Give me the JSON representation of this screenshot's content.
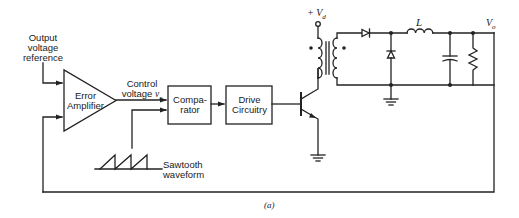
{
  "figure": {
    "caption": "(a)",
    "stroke_color": "#222222"
  },
  "labels": {
    "output_voltage_reference": [
      "Output",
      "voltage",
      "reference"
    ],
    "error_amplifier": [
      "Error",
      "Amplifier"
    ],
    "control_voltage": [
      "Control",
      "voltage"
    ],
    "control_voltage_symbol": "v",
    "control_voltage_subscript": "c",
    "comparator": [
      "Compa-",
      "rator"
    ],
    "drive_circuitry": [
      "Drive",
      "Circuitry"
    ],
    "sawtooth_waveform": [
      "Sawtooth",
      "waveform"
    ],
    "supply_voltage": "+ V",
    "supply_voltage_subscript": "d",
    "inductor": "L",
    "output_voltage": "V",
    "output_voltage_subscript": "o"
  },
  "components": [
    {
      "id": "error-amplifier",
      "type": "op-amp"
    },
    {
      "id": "comparator",
      "type": "block"
    },
    {
      "id": "drive-circuitry",
      "type": "block"
    },
    {
      "id": "sawtooth-generator",
      "type": "waveform"
    },
    {
      "id": "switching-transistor",
      "type": "npn-bjt"
    },
    {
      "id": "transformer",
      "type": "transformer"
    },
    {
      "id": "rectifier-diode",
      "type": "diode"
    },
    {
      "id": "freewheeling-diode",
      "type": "diode"
    },
    {
      "id": "output-inductor",
      "type": "inductor"
    },
    {
      "id": "output-capacitor",
      "type": "capacitor"
    },
    {
      "id": "load-resistor",
      "type": "resistor"
    }
  ]
}
